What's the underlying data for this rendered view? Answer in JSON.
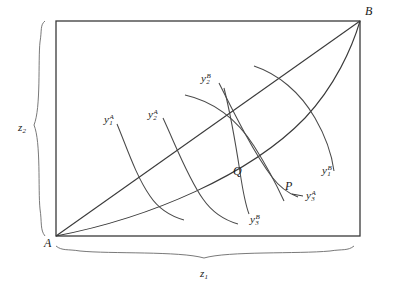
{
  "figure": {
    "type": "edgeworth-box"
  },
  "box": {
    "left": 56,
    "top": 21,
    "right": 360,
    "bottom": 236,
    "stroke_color": "#3a3a3a"
  },
  "origins": {
    "a": {
      "label": "A",
      "x": 44,
      "y": 244
    },
    "b": {
      "label": "B",
      "x": 365,
      "y": 12
    }
  },
  "points": [
    {
      "name": "Q",
      "label": "Q",
      "x": 233,
      "y": 172,
      "mark_x": 241,
      "mark_y": 150
    },
    {
      "name": "P",
      "label": "P",
      "x": 287,
      "y": 187,
      "mark_x": 297,
      "mark_y": 196
    }
  ],
  "axes": {
    "horizontal": {
      "label_base": "z",
      "label_sub": "1",
      "x": 204,
      "y": 270
    },
    "vertical": {
      "label_base": "z",
      "label_sub": "2",
      "x": 22,
      "y": 124
    }
  },
  "curves_a": [
    {
      "name": "y1A",
      "base": "y",
      "sub": "1",
      "sup": "A",
      "label_x": 104,
      "label_y": 116
    },
    {
      "name": "y2A",
      "base": "y",
      "sub": "2",
      "sup": "A",
      "label_x": 150,
      "label_y": 111
    },
    {
      "name": "y3A",
      "base": "y",
      "sub": "3",
      "sup": "A",
      "label_x": 312,
      "label_y": 192
    }
  ],
  "curves_b": [
    {
      "name": "y1B",
      "base": "y",
      "sub": "1",
      "sup": "B",
      "label_x": 327,
      "label_y": 167
    },
    {
      "name": "y2B",
      "base": "y",
      "sub": "2",
      "sup": "B",
      "label_x": 203,
      "label_y": 75
    },
    {
      "name": "y3B",
      "base": "y",
      "sub": "3",
      "sup": "B",
      "label_x": 252,
      "label_y": 216
    }
  ],
  "colors": {
    "line": "#3a3a3a",
    "curve": "#4a4a4a",
    "text": "#1a1a1a",
    "background": "#ffffff"
  }
}
